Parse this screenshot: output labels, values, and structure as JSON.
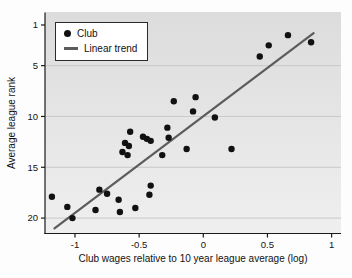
{
  "chart_data": {
    "type": "scatter",
    "title": "",
    "xlabel": "Club wages relative to 10 year league average (log)",
    "ylabel": "Average league rank",
    "x_ticks": [
      -1,
      -0.5,
      0,
      0.5,
      1
    ],
    "x_tick_labels": [
      "-1",
      "-0.5",
      "0",
      "0.5",
      "1"
    ],
    "y_ticks": [
      1,
      5,
      10,
      15,
      20
    ],
    "y_tick_labels": [
      "1",
      "5",
      "10",
      "15",
      "20"
    ],
    "xlim": [
      -1.23,
      1.07
    ],
    "ylim": [
      -0.2,
      21.7
    ],
    "y_axis_reversed": true,
    "grid": "horizontal",
    "legend_position": "top-left",
    "colors": {
      "point": "#111111",
      "trend": "#5c5c5c",
      "plot_bg": "#e6e6e6",
      "grid": "#c9c9c9",
      "axis": "#1a1a1a",
      "legend_bg": "#ffffff",
      "legend_border": "#2b2b2b"
    },
    "series": [
      {
        "name": "Club",
        "type": "scatter",
        "points": [
          [
            0.66,
            2.0
          ],
          [
            0.84,
            2.7
          ],
          [
            0.51,
            3.0
          ],
          [
            0.44,
            4.1
          ],
          [
            -0.06,
            8.1
          ],
          [
            -0.23,
            8.5
          ],
          [
            -0.08,
            9.5
          ],
          [
            0.09,
            10.1
          ],
          [
            -0.28,
            11.1
          ],
          [
            -0.57,
            11.5
          ],
          [
            -0.47,
            12.0
          ],
          [
            -0.27,
            12.1
          ],
          [
            -0.44,
            12.2
          ],
          [
            -0.41,
            12.4
          ],
          [
            -0.61,
            12.6
          ],
          [
            -0.58,
            12.9
          ],
          [
            -0.13,
            13.2
          ],
          [
            0.22,
            13.2
          ],
          [
            -0.63,
            13.5
          ],
          [
            -0.59,
            13.8
          ],
          [
            -0.32,
            13.8
          ],
          [
            -0.41,
            16.8
          ],
          [
            -0.81,
            17.2
          ],
          [
            -0.75,
            17.6
          ],
          [
            -0.42,
            17.7
          ],
          [
            -1.18,
            17.9
          ],
          [
            -0.66,
            18.2
          ],
          [
            -1.06,
            18.9
          ],
          [
            -0.53,
            19.0
          ],
          [
            -0.84,
            19.2
          ],
          [
            -0.65,
            19.4
          ],
          [
            -1.02,
            20.0
          ]
        ]
      },
      {
        "name": "Linear trend",
        "type": "line",
        "x": [
          -1.16,
          0.86
        ],
        "rank": [
          21.0,
          1.8
        ]
      }
    ]
  }
}
